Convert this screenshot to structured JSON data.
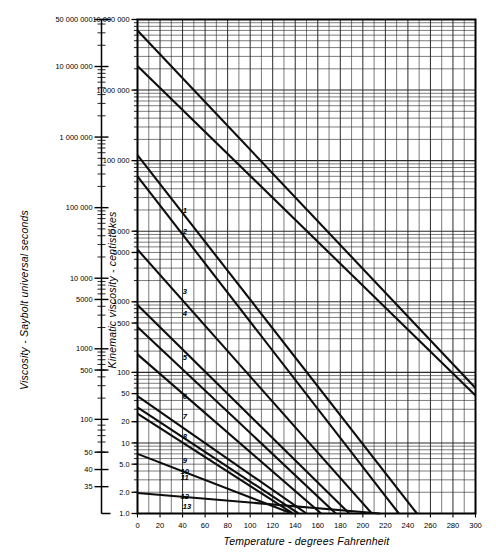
{
  "chart_data": {
    "type": "line",
    "title": "",
    "xlabel": "Temperature - degrees Fahrenheit",
    "ylabel_primary": "Viscosity - Saybolt universal seconds",
    "ylabel_secondary": "Kinematic viscosity - centistokes",
    "xlim": [
      0,
      300
    ],
    "xticks": [
      0,
      20,
      40,
      60,
      80,
      100,
      120,
      140,
      160,
      180,
      200,
      220,
      240,
      260,
      280,
      300
    ],
    "xtick_labels": [
      "0",
      "20",
      "40",
      "60",
      "80",
      "100",
      "120",
      "140",
      "160",
      "180",
      "200",
      "220",
      "240",
      "260",
      "280",
      "300"
    ],
    "x_minor_step": 10,
    "yscale": "log",
    "ylim_centistokes": [
      1.0,
      10000000
    ],
    "yticks_centistokes": [
      10000000,
      1000000,
      100000,
      10000,
      5000,
      1000,
      500,
      100,
      50,
      20,
      10,
      5.0,
      2.0,
      1.0
    ],
    "ytick_labels_centistokes": [
      "10 000 000",
      "1 000 000",
      "100 000",
      "10 000",
      "5000",
      "1000",
      "500",
      "100",
      "50",
      "20",
      "10",
      "5.0",
      "2.0",
      "1.0"
    ],
    "yticks_saybolt": [
      50000000,
      10000000,
      1000000,
      100000,
      10000,
      5000,
      1000,
      500,
      100,
      50,
      40,
      35
    ],
    "ytick_labels_saybolt": [
      "50 000 000",
      "10 000 000",
      "1 000 000",
      "100 000",
      "10 000",
      "5000",
      "1000",
      "500",
      "100",
      "50",
      "40",
      "35"
    ],
    "grid": true,
    "legend": "none",
    "series": [
      {
        "name": "1",
        "label": "1",
        "label_at": [
          42,
          18000
        ],
        "x": [
          0,
          300
        ],
        "y": [
          7000000,
          60
        ]
      },
      {
        "name": "2",
        "label": "2",
        "label_at": [
          42,
          9000
        ],
        "x": [
          0,
          300
        ],
        "y": [
          2200000,
          47
        ]
      },
      {
        "name": "3",
        "label": "3",
        "label_at": [
          42,
          1300
        ],
        "x": [
          0,
          248
        ],
        "y": [
          120000,
          1.0
        ]
      },
      {
        "name": "4",
        "label": "4",
        "label_at": [
          42,
          620
        ],
        "x": [
          0,
          232
        ],
        "y": [
          60000,
          1.0
        ]
      },
      {
        "name": "5",
        "label": "5",
        "label_at": [
          42,
          150
        ],
        "x": [
          0,
          208
        ],
        "y": [
          5500,
          1.0
        ]
      },
      {
        "name": "6",
        "label": "6",
        "label_at": [
          42,
          42
        ],
        "x": [
          0,
          188
        ],
        "y": [
          900,
          1.0
        ]
      },
      {
        "name": "7",
        "label": "7",
        "label_at": [
          42,
          22
        ],
        "x": [
          0,
          176
        ],
        "y": [
          440,
          1.0
        ]
      },
      {
        "name": "8",
        "label": "8",
        "label_at": [
          42,
          11.5
        ],
        "x": [
          0,
          163
        ],
        "y": [
          180,
          1.0
        ]
      },
      {
        "name": "9",
        "label": "9",
        "label_at": [
          42,
          5.2
        ],
        "x": [
          0,
          150
        ],
        "y": [
          46,
          1.0
        ]
      },
      {
        "name": "10",
        "label": "10",
        "label_at": [
          42,
          3.6
        ],
        "x": [
          0,
          143
        ],
        "y": [
          32,
          1.0
        ]
      },
      {
        "name": "11",
        "label": "11",
        "label_at": [
          42,
          3.0
        ],
        "x": [
          0,
          138
        ],
        "y": [
          26,
          1.0
        ]
      },
      {
        "name": "12",
        "label": "12",
        "label_at": [
          42,
          1.62
        ],
        "x": [
          0,
          137
        ],
        "y": [
          7.0,
          1.0
        ]
      },
      {
        "name": "13",
        "label": "13",
        "label_at": [
          44,
          1.15
        ],
        "x": [
          0,
          215
        ],
        "y": [
          1.95,
          1.0
        ]
      }
    ]
  },
  "curve_numbers": [
    "1",
    "2",
    "3",
    "4",
    "5",
    "6",
    "7",
    "8",
    "9",
    "10",
    "11",
    "12",
    "13"
  ]
}
